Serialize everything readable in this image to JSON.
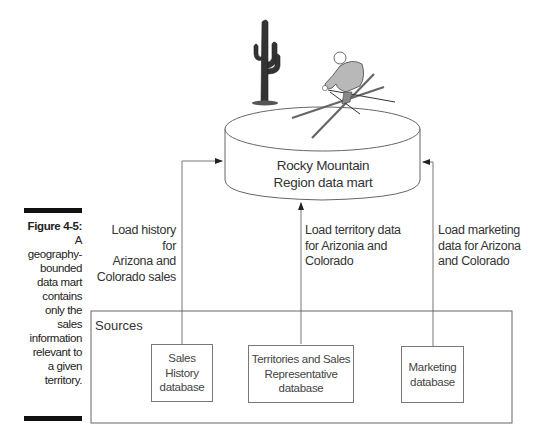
{
  "caption": {
    "figure_label": "Figure 4-5:",
    "text": "A geography-bounded data mart contains only the sales information relevant to a given territory."
  },
  "data_mart": {
    "line1": "Rocky Mountain",
    "line2": "Region data mart",
    "illustrations": [
      "saguaro-cactus",
      "skier"
    ]
  },
  "arrows": [
    {
      "label_lines": [
        "Load history for",
        "Arizona and",
        "Colorado sales"
      ]
    },
    {
      "label_lines": [
        "Load territory data",
        "for Arizonia and",
        "Colorado"
      ]
    },
    {
      "label_lines": [
        "Load marketing",
        "data for Arizona",
        "and Colorado"
      ]
    }
  ],
  "sources": {
    "title": "Sources",
    "databases": [
      {
        "lines": [
          "Sales",
          "History",
          "database"
        ]
      },
      {
        "lines": [
          "Territories and Sales",
          "Representative",
          "database"
        ]
      },
      {
        "lines": [
          "Marketing",
          "database"
        ]
      }
    ]
  },
  "colors": {
    "line": "#666666",
    "caption_bar": "#111111",
    "skier_fill": "#b8b8b8",
    "cactus_fill": "#333333"
  }
}
